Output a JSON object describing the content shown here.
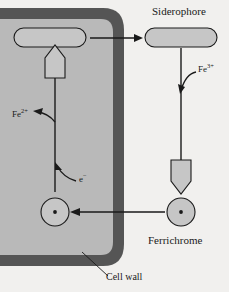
{
  "figure": {
    "colors": {
      "background": "#f1f0ee",
      "cell_wall": "#555555",
      "cytoplasm": "#b9b9b9",
      "shape_fill": "#c6c6c6",
      "stroke": "#1a1a1a"
    },
    "labels": {
      "siderophore": "Siderophore",
      "ferrichrome": "Ferrichrome",
      "cell_wall": "Cell wall",
      "ferric_ion": "Fe",
      "ferric_ion_charge": "3+",
      "ferrous_ion": "Fe",
      "ferrous_ion_charge": "2+",
      "electron": "e",
      "electron_charge": "−"
    }
  }
}
